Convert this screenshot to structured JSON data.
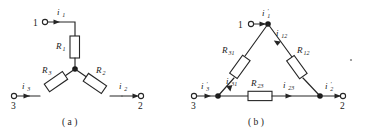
{
  "figure": {
    "panels": [
      {
        "id": "a",
        "caption": "( a )",
        "topology": "wye",
        "terminals": [
          {
            "name": "terminal-1",
            "label": "1"
          },
          {
            "name": "terminal-2",
            "label": "2"
          },
          {
            "name": "terminal-3",
            "label": "3"
          }
        ],
        "resistors": [
          {
            "name": "resistor-r1",
            "base": "R",
            "sub": "1"
          },
          {
            "name": "resistor-r2",
            "base": "R",
            "sub": "2"
          },
          {
            "name": "resistor-r3",
            "base": "R",
            "sub": "3"
          }
        ],
        "currents": [
          {
            "name": "current-i1",
            "base": "i",
            "sub": "1",
            "prime": ""
          },
          {
            "name": "current-i2",
            "base": "i",
            "sub": "2",
            "prime": ""
          },
          {
            "name": "current-i3",
            "base": "i",
            "sub": "3",
            "prime": ""
          }
        ]
      },
      {
        "id": "b",
        "caption": "( b )",
        "topology": "delta",
        "terminals": [
          {
            "name": "terminal-1",
            "label": "1"
          },
          {
            "name": "terminal-2",
            "label": "2"
          },
          {
            "name": "terminal-3",
            "label": "3"
          }
        ],
        "resistors": [
          {
            "name": "resistor-r12",
            "base": "R",
            "sub": "12"
          },
          {
            "name": "resistor-r23",
            "base": "R",
            "sub": "23"
          },
          {
            "name": "resistor-r31",
            "base": "R",
            "sub": "31"
          }
        ],
        "currents": [
          {
            "name": "current-i1-prime",
            "base": "i",
            "sub": "1",
            "prime": "′"
          },
          {
            "name": "current-i2-prime",
            "base": "i",
            "sub": "2",
            "prime": "′"
          },
          {
            "name": "current-i3-prime",
            "base": "i",
            "sub": "3",
            "prime": "′"
          },
          {
            "name": "current-i12",
            "base": "i",
            "sub": "12",
            "prime": ""
          },
          {
            "name": "current-i23",
            "base": "i",
            "sub": "23",
            "prime": ""
          },
          {
            "name": "current-i31",
            "base": "i",
            "sub": "31",
            "prime": ""
          }
        ]
      }
    ],
    "colors": {
      "ink": "#262626",
      "background": "#ffffff"
    }
  }
}
